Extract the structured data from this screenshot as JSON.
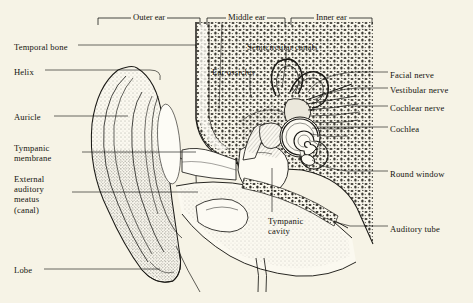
{
  "figure": {
    "background_color": "#f6f3e6",
    "ink_color": "#1b1a16",
    "style": "pen-and-ink stipple engraving"
  },
  "brackets": [
    {
      "label": "Outer ear",
      "x1": 98,
      "x2": 200,
      "y": 18
    },
    {
      "label": "Middle ear",
      "x1": 207,
      "x2": 285,
      "y": 18
    },
    {
      "label": "Inner ear",
      "x1": 291,
      "x2": 372,
      "y": 18
    }
  ],
  "labels_left": [
    {
      "text": "Temporal bone",
      "x": 14,
      "y": 42,
      "lead_to_x": 150,
      "lead_to_y": 47
    },
    {
      "text": "Helix",
      "x": 14,
      "y": 67,
      "lead_to_x": 122,
      "lead_to_y": 72
    },
    {
      "text": "Auricle",
      "x": 14,
      "y": 112,
      "lead_to_x": 112,
      "lead_to_y": 117
    },
    {
      "text": "Tympanic\nmembrane",
      "x": 14,
      "y": 143,
      "lead_to_x": 196,
      "lead_to_y": 153
    },
    {
      "text": "External\nauditory\nmeatus\n(canal)",
      "x": 14,
      "y": 174,
      "lead_to_x": 175,
      "lead_to_y": 193
    },
    {
      "text": "Lobe",
      "x": 14,
      "y": 265,
      "lead_to_x": 135,
      "lead_to_y": 270
    }
  ],
  "labels_right": [
    {
      "text": "Facial nerve",
      "x": 390,
      "y": 70,
      "lead_to_x": 312,
      "lead_to_y": 85
    },
    {
      "text": "Vestibular nerve",
      "x": 390,
      "y": 85,
      "lead_to_x": 318,
      "lead_to_y": 96
    },
    {
      "text": "Cochlear nerve",
      "x": 390,
      "y": 103,
      "lead_to_x": 322,
      "lead_to_y": 107
    },
    {
      "text": "Cochlea",
      "x": 390,
      "y": 124,
      "lead_to_x": 300,
      "lead_to_y": 128
    },
    {
      "text": "Round window",
      "x": 390,
      "y": 169,
      "lead_to_x": 330,
      "lead_to_y": 157
    },
    {
      "text": "Auditory tube",
      "x": 390,
      "y": 224,
      "lead_to_x": 330,
      "lead_to_y": 215
    }
  ],
  "labels_center": [
    {
      "text": "Semicircular canals",
      "x": 247,
      "y": 42,
      "lead_to_x": 283,
      "lead_to_y": 88
    },
    {
      "text": "Ear ossicles",
      "x": 212,
      "y": 67,
      "lead_to_x": 253,
      "lead_to_y": 96
    },
    {
      "text": "Tympanic\ncavity",
      "x": 268,
      "y": 216,
      "lead_to_x": 272,
      "lead_to_y": 160
    }
  ]
}
